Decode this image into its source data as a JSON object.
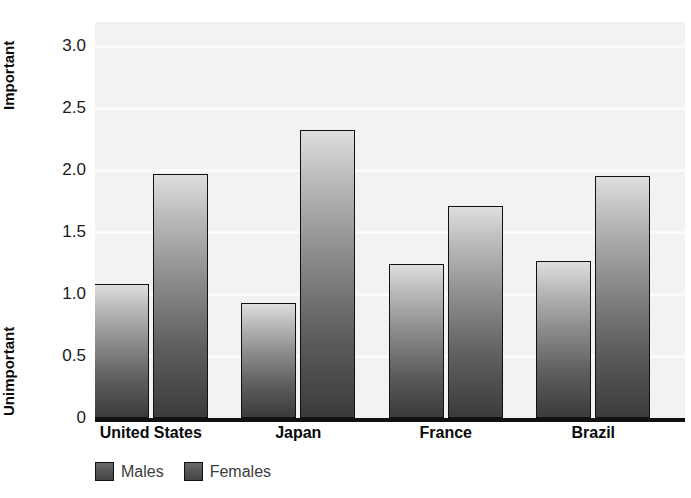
{
  "chart_data": {
    "type": "bar",
    "title": "",
    "xlabel": "",
    "ylabel": "",
    "axis_low_label": "Unimportant",
    "axis_high_label": "Important",
    "categories": [
      "United States",
      "Japan",
      "France",
      "Brazil"
    ],
    "ytick_labels": [
      "3.0",
      "2.5",
      "2.0",
      "1.5",
      "1.0",
      "0.5",
      "0"
    ],
    "ytick_values": [
      3.0,
      2.5,
      2.0,
      1.5,
      1.0,
      0.5,
      0
    ],
    "ylim": [
      0,
      3.2
    ],
    "grid": true,
    "legend_position": "below-axis-left",
    "series": [
      {
        "name": "Males",
        "color": "#4a4a4a",
        "values": [
          1.08,
          0.93,
          1.24,
          1.27
        ]
      },
      {
        "name": "Females",
        "color": "#4a4a4a",
        "values": [
          1.97,
          2.32,
          1.71,
          1.95
        ]
      }
    ]
  },
  "legend": {
    "entries": [
      {
        "label": "Males"
      },
      {
        "label": "Females"
      }
    ]
  }
}
